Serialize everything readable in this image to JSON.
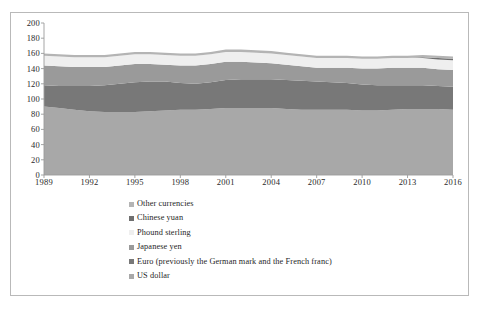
{
  "chart_data": {
    "type": "area",
    "stacked": true,
    "title": "",
    "xlabel": "",
    "ylabel": "",
    "xlim": [
      1989,
      2016
    ],
    "ylim": [
      0,
      200
    ],
    "ytick_step": 20,
    "xtick_step": 3,
    "grid": false,
    "legend_position": "bottom-left",
    "x": [
      1989,
      1990,
      1991,
      1992,
      1993,
      1994,
      1995,
      1996,
      1997,
      1998,
      1999,
      2000,
      2001,
      2002,
      2003,
      2004,
      2005,
      2006,
      2007,
      2008,
      2009,
      2010,
      2011,
      2012,
      2013,
      2014,
      2015,
      2016
    ],
    "xticks": [
      1989,
      1992,
      1995,
      1998,
      2001,
      2004,
      2007,
      2010,
      2013,
      2016
    ],
    "yticks": [
      0,
      20,
      40,
      60,
      80,
      100,
      120,
      140,
      160,
      180,
      200
    ],
    "series": [
      {
        "name": "US dollar",
        "color": "#a8a8a8",
        "values": [
          90,
          88,
          86,
          84,
          83,
          83,
          83,
          84,
          85,
          86,
          86,
          87,
          88,
          88,
          88,
          88,
          87,
          86,
          86,
          86,
          86,
          85,
          85,
          86,
          87,
          87,
          87,
          86
        ]
      },
      {
        "name": "Euro (previously the German mark and the French franc)",
        "color": "#787878",
        "values": [
          28,
          29,
          31,
          33,
          35,
          37,
          39,
          39,
          38,
          35,
          34,
          35,
          37,
          38,
          38,
          38,
          38,
          38,
          37,
          36,
          35,
          34,
          33,
          32,
          31,
          31,
          30,
          30
        ]
      },
      {
        "name": "Japanese yen",
        "color": "#9a9a9a",
        "values": [
          26,
          26,
          25,
          25,
          24,
          24,
          24,
          23,
          22,
          23,
          24,
          24,
          24,
          23,
          22,
          21,
          20,
          19,
          18,
          19,
          20,
          21,
          22,
          23,
          23,
          23,
          22,
          22
        ]
      },
      {
        "name": "Phound sterling",
        "color": "#efefef",
        "values": [
          13,
          13,
          13,
          13,
          13,
          13,
          13,
          13,
          13,
          13,
          13,
          13,
          13,
          13,
          13,
          13,
          13,
          13,
          13,
          13,
          13,
          13,
          13,
          13,
          13,
          13,
          13,
          13
        ]
      },
      {
        "name": "Chinese yuan",
        "color": "#6f6f6f",
        "values": [
          0,
          0,
          0,
          0,
          0,
          0,
          0,
          0,
          0,
          0,
          0,
          0,
          0,
          0,
          0,
          0,
          0,
          0,
          0,
          0,
          0,
          0,
          0,
          0,
          0,
          1,
          2,
          2
        ]
      },
      {
        "name": "Other currencies",
        "color": "#b4b4b4",
        "values": [
          3,
          3,
          3,
          3,
          3,
          3,
          3,
          3,
          3,
          3,
          3,
          3,
          3,
          3,
          3,
          3,
          3,
          3,
          3,
          3,
          3,
          3,
          3,
          3,
          3,
          3,
          3,
          3
        ]
      }
    ],
    "legend_entries": [
      {
        "label": "Other currencies",
        "color": "#b4b4b4"
      },
      {
        "label": "Chinese yuan",
        "color": "#6f6f6f"
      },
      {
        "label": "Phound sterling",
        "color": "#efefef"
      },
      {
        "label": "Japanese yen",
        "color": "#9a9a9a"
      },
      {
        "label": "Euro (previously the German mark and the French franc)",
        "color": "#787878"
      },
      {
        "label": "US dollar",
        "color": "#a8a8a8"
      }
    ],
    "axis_color": "#9b9b9b",
    "tick_label_color": "#2a2a2a"
  }
}
